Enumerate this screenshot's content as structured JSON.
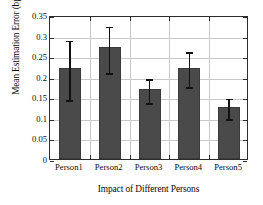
{
  "chart_data": {
    "type": "bar",
    "title": "",
    "xlabel": "Impact of Different Persons",
    "ylabel": "Mean Estimation Error (bpm)",
    "categories": [
      "Person1",
      "Person2",
      "Person3",
      "Person4",
      "Person5"
    ],
    "values": [
      0.221,
      0.272,
      0.17,
      0.221,
      0.126
    ],
    "error_low": [
      0.148,
      0.214,
      0.141,
      0.18,
      0.102
    ],
    "error_high": [
      0.292,
      0.326,
      0.199,
      0.265,
      0.151
    ],
    "error_minus": [
      0.073,
      0.058,
      0.029,
      0.041,
      0.024
    ],
    "error_plus": [
      0.071,
      0.054,
      0.029,
      0.044,
      0.025
    ],
    "ylim": [
      0,
      0.35
    ],
    "xlim": [
      0,
      5
    ],
    "ytick_labels": [
      "0",
      "0.05",
      "0.1",
      "0.15",
      "0.2",
      "0.25",
      "0.3",
      "0.35"
    ],
    "ytick_values": [
      0,
      0.05,
      0.1,
      0.15,
      0.2,
      0.25,
      0.3,
      0.35
    ],
    "grid": true,
    "grid_axis": "both",
    "legend": false,
    "bar_color": "#4a4a4a",
    "error_color": "#111111",
    "grid_color": "#c9c9c9",
    "frame_color": "#2d2d2d",
    "background": "#ffffff"
  }
}
